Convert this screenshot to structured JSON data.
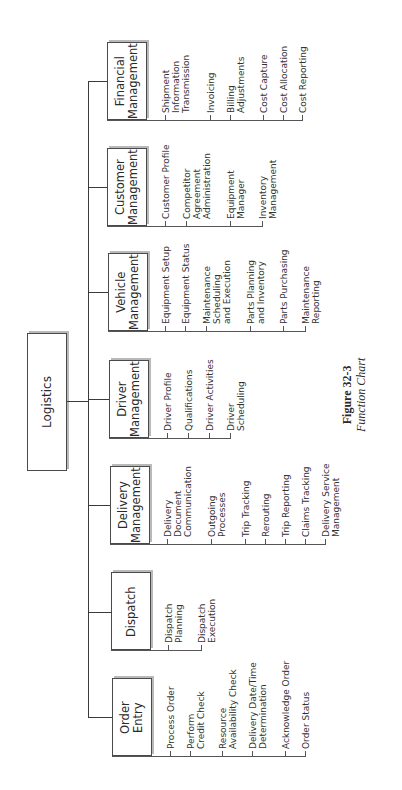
{
  "root": {
    "label": "Logistics"
  },
  "caption": {
    "figure": "Figure 32-3",
    "title": "Function Chart"
  },
  "functions": [
    {
      "label": "Financial\nManagement",
      "items": [
        "Shipment\nInformation\nTransmission",
        "Invoicing",
        "Billing\nAdjustments",
        "Cost Capture",
        "Cost Allocation",
        "Cost Reporting"
      ]
    },
    {
      "label": "Customer\nManagement",
      "items": [
        "Customer Profile",
        "Competitor\nAgreement\nAdministration",
        "Equipment\nManager",
        "Inventory\nManagement"
      ]
    },
    {
      "label": "Vehicle\nManagement",
      "items": [
        "Equipment Setup",
        "Equipment Status",
        "Maintenance\nScheduling\nand Execution",
        "Parts Planning\nand Inventory",
        "Parts Purchasing",
        "Maintenance\nReporting"
      ]
    },
    {
      "label": "Driver\nManagement",
      "items": [
        "Driver Profile",
        "Qualifications",
        "Driver Activities",
        "Driver\nScheduling"
      ]
    },
    {
      "label": "Delivery\nManagement",
      "items": [
        "Delivery\nDocument\nCommunication",
        "Outgoing\nProcesses",
        "Trip Tracking",
        "Rerouting",
        "Trip Reporting",
        "Claims Tracking",
        "Delivery Service\nManagement"
      ]
    },
    {
      "label": "Dispatch",
      "items": [
        "Dispatch\nPlanning",
        "Dispatch\nExecution"
      ]
    },
    {
      "label": "Order\nEntry",
      "items": [
        "Process Order",
        "Perform\nCredit Check",
        "Resource\nAvailability Check",
        "Delivery Date/Time\nDetermination",
        "Acknowledge Order",
        "Order Status"
      ]
    }
  ]
}
